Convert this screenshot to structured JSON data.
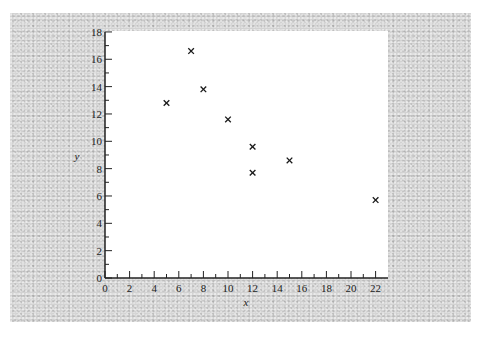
{
  "chart_data": {
    "type": "scatter",
    "title": "",
    "xlabel": "x",
    "ylabel": "y",
    "xlim": [
      0,
      23
    ],
    "ylim": [
      0,
      18
    ],
    "x_ticks": [
      0,
      2,
      4,
      6,
      8,
      10,
      12,
      14,
      16,
      18,
      20,
      22
    ],
    "y_ticks": [
      0,
      2,
      4,
      6,
      8,
      10,
      12,
      14,
      16,
      18
    ],
    "x_minor_ticks": [
      1,
      3,
      5,
      7,
      9,
      11,
      13,
      15,
      17,
      19,
      21
    ],
    "y_minor_ticks": [
      1,
      3,
      5,
      7,
      9,
      11,
      13,
      15,
      17
    ],
    "grid": false,
    "legend": null,
    "marker": "x",
    "marker_color": "#1a1a1a",
    "series": [
      {
        "name": "data",
        "points": [
          {
            "x": 5,
            "y": 12.8
          },
          {
            "x": 7,
            "y": 16.6
          },
          {
            "x": 8,
            "y": 13.8
          },
          {
            "x": 10,
            "y": 11.6
          },
          {
            "x": 12,
            "y": 9.6
          },
          {
            "x": 12,
            "y": 7.7
          },
          {
            "x": 15,
            "y": 8.6
          },
          {
            "x": 22,
            "y": 5.7
          }
        ]
      }
    ]
  },
  "colors": {
    "background_texture": "#d2d2d2",
    "plot_area": "#ffffff",
    "axis": "#222222"
  }
}
